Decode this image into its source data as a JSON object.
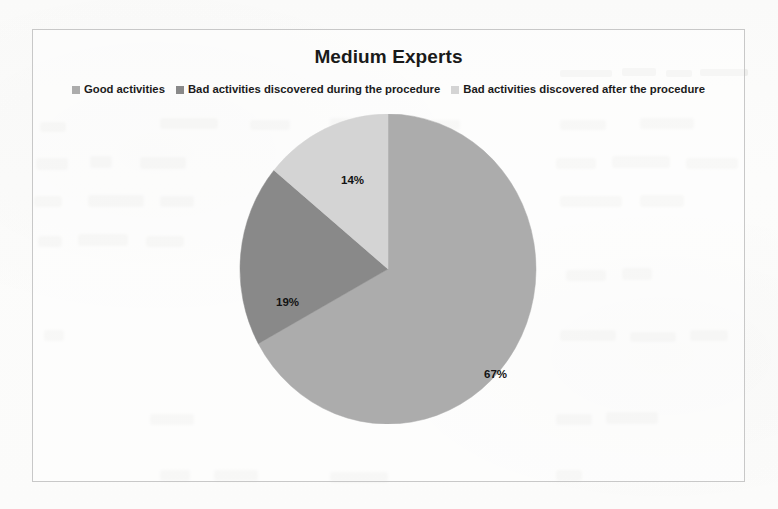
{
  "chart": {
    "title": "Medium Experts",
    "frame_border_color": "#c9c9c9"
  },
  "legend": {
    "items": [
      {
        "label": "Good activities",
        "color": "#adadad",
        "swatch_icon": "legend-square-icon"
      },
      {
        "label": "Bad activities discovered during the procedure",
        "color": "#8a8a8a",
        "swatch_icon": "legend-square-icon"
      },
      {
        "label": "Bad activities discovered after the procedure",
        "color": "#d5d5d5",
        "swatch_icon": "legend-square-icon"
      }
    ]
  },
  "labels": {
    "good": "67%",
    "during": "19%",
    "after": "14%"
  },
  "chart_data": {
    "type": "pie",
    "title": "Medium Experts",
    "categories": [
      "Good activities",
      "Bad activities discovered during the procedure",
      "Bad activities discovered after the procedure"
    ],
    "values": [
      67,
      19,
      14
    ],
    "unit": "%",
    "data_labels": [
      "67%",
      "19%",
      "14%"
    ],
    "colors": [
      "#adadad",
      "#8a8a8a",
      "#d5d5d5"
    ],
    "legend_position": "top",
    "start_angle_deg": 0,
    "direction": "clockwise",
    "grid": false,
    "xlabel": "",
    "ylabel": ""
  }
}
